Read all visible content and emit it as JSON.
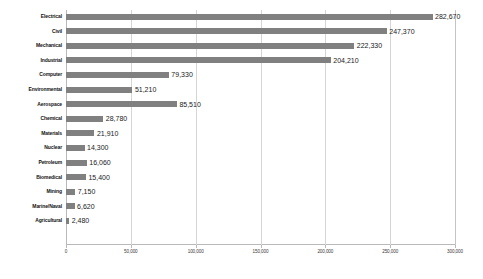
{
  "chart_data": {
    "type": "bar",
    "orientation": "horizontal",
    "title": "",
    "subtitle": "",
    "xlabel": "",
    "ylabel": "",
    "legend": [],
    "legend_position": "none",
    "grid": true,
    "xlim": [
      0,
      300000
    ],
    "xticks": [
      0,
      50000,
      100000,
      150000,
      200000,
      250000,
      300000
    ],
    "xtick_labels": [
      "0",
      "50,000",
      "100,000",
      "150,000",
      "200,000",
      "250,000",
      "300,000"
    ],
    "bar_color": "#808080",
    "gridline_color": "#d5d5d5",
    "axis_color": "#b9b9b9",
    "categories": [
      "Electrical",
      "Civil",
      "Mechanical",
      "Industrial",
      "Computer",
      "Environmental",
      "Aerospace",
      "Chemical",
      "Materials",
      "Nuclear",
      "Petroleum",
      "Biomedical",
      "Mining",
      "Marine/Naval",
      "Agricultural"
    ],
    "values": [
      282670,
      247370,
      222330,
      204210,
      79330,
      51210,
      85510,
      28780,
      21910,
      14300,
      16060,
      15400,
      7150,
      6620,
      2480
    ],
    "value_labels": [
      "282,670",
      "247,370",
      "222,330",
      "204,210",
      "79,330",
      "51,210",
      "85,510",
      "28,780",
      "21,910",
      "14,300",
      "16,060",
      "15,400",
      "7,150",
      "6,620",
      "2,480"
    ]
  }
}
